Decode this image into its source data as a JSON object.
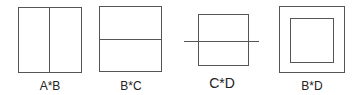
{
  "figures": [
    {
      "label": "A*B",
      "shape": "square-with-vertical-divider"
    },
    {
      "label": "B*C",
      "shape": "square-with-horizontal-divider"
    },
    {
      "label": "C*D",
      "shape": "square-crossed-by-horizontal-line"
    },
    {
      "label": "B*D",
      "shape": "square-inside-square"
    }
  ],
  "colors": {
    "stroke": "#555555",
    "text": "#222222",
    "background": "#ffffff"
  }
}
